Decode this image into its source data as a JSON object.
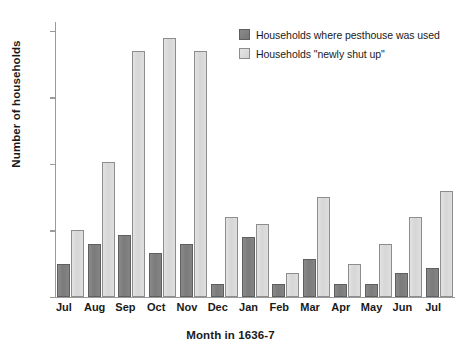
{
  "chart_data": {
    "type": "bar",
    "title": "",
    "xlabel": "Month in 1636-7",
    "ylabel": "Number of households",
    "categories": [
      "Jul",
      "Aug",
      "Sep",
      "Oct",
      "Nov",
      "Dec",
      "Jan",
      "Feb",
      "Mar",
      "Apr",
      "May",
      "Jun",
      "Jul"
    ],
    "series": [
      {
        "name": "Households where pesthouse was used",
        "color": "#7b7b7b",
        "values": [
          7.5,
          12,
          14,
          10,
          12,
          3,
          13.5,
          3,
          8.5,
          3,
          3,
          5.5,
          6.5
        ]
      },
      {
        "name": "Households \"newly shut up\"",
        "color": "#d8d8d8",
        "values": [
          15,
          30.5,
          55.5,
          58.5,
          55.5,
          18,
          16.5,
          5.5,
          22.5,
          7.5,
          12,
          18,
          24
        ]
      }
    ],
    "ylim": [
      0,
      62
    ],
    "yticks": [
      0,
      15,
      30,
      45,
      60
    ],
    "ytick_labels": [
      "0",
      "15",
      "30",
      "45",
      "60"
    ],
    "grid": false,
    "legend_position": "top-right"
  },
  "legend": {
    "items": [
      {
        "label": "Households where pesthouse was used"
      },
      {
        "label": "Households \"newly shut up\""
      }
    ]
  },
  "axes": {
    "y_title": "Number of households",
    "x_title": "Month in 1636-7"
  }
}
